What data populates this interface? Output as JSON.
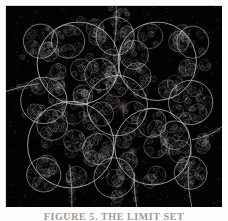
{
  "figure": {
    "caption": "FIGURE 5.  THE LIMIT SET",
    "plate": {
      "background_color": "#030303",
      "curve_color": "#d8d8d8",
      "width": 216,
      "height": 201
    },
    "glow_points": [
      {
        "name": "center-glow",
        "x": 0.54,
        "y": 0.5,
        "radius": 9,
        "color": "#3a3230"
      },
      {
        "name": "right-eye-glow",
        "x": 0.74,
        "y": 0.665,
        "radius": 8,
        "color": "#4a3c38"
      },
      {
        "name": "left-eye-glow",
        "x": 0.585,
        "y": 0.725,
        "radius": 7,
        "color": "#3c2e2c"
      }
    ],
    "threads": [
      {
        "name": "thread-top",
        "from": [
          0.51,
          0.0
        ],
        "to": [
          0.5,
          0.21
        ]
      },
      {
        "name": "thread-left",
        "from": [
          0.0,
          0.425
        ],
        "to": [
          0.155,
          0.385
        ]
      },
      {
        "name": "thread-right",
        "from": [
          1.0,
          0.6
        ],
        "to": [
          0.86,
          0.665
        ]
      },
      {
        "name": "thread-bottom-left",
        "from": [
          0.295,
          0.79
        ],
        "to": [
          0.305,
          1.0
        ]
      },
      {
        "name": "thread-bottom-center",
        "from": [
          0.595,
          0.83
        ],
        "to": [
          0.605,
          1.0
        ]
      },
      {
        "name": "thread-bottom-right",
        "from": [
          0.845,
          0.8
        ],
        "to": [
          0.86,
          1.0
        ]
      }
    ],
    "structure": {
      "type": "kleinian-limit-set",
      "description": "Apollonian style circle packing fractal, white curves on black ground",
      "seed": 20240517,
      "depth": 7,
      "root_circles": [
        {
          "cx": 0.335,
          "cy": 0.285,
          "r": 0.205
        },
        {
          "cx": 0.7,
          "cy": 0.275,
          "r": 0.195
        },
        {
          "cx": 0.3,
          "cy": 0.69,
          "r": 0.215
        },
        {
          "cx": 0.68,
          "cy": 0.7,
          "r": 0.19
        },
        {
          "cx": 0.515,
          "cy": 0.495,
          "r": 0.15
        },
        {
          "cx": 0.175,
          "cy": 0.47,
          "r": 0.115
        },
        {
          "cx": 0.855,
          "cy": 0.48,
          "r": 0.11
        },
        {
          "cx": 0.505,
          "cy": 0.15,
          "r": 0.095
        },
        {
          "cx": 0.5,
          "cy": 0.855,
          "r": 0.1
        },
        {
          "cx": 0.16,
          "cy": 0.175,
          "r": 0.085
        },
        {
          "cx": 0.865,
          "cy": 0.18,
          "r": 0.08
        },
        {
          "cx": 0.175,
          "cy": 0.84,
          "r": 0.085
        },
        {
          "cx": 0.855,
          "cy": 0.83,
          "r": 0.082
        }
      ]
    }
  }
}
